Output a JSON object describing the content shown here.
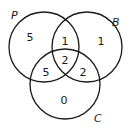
{
  "diagram": {
    "type": "venn",
    "sets": [
      {
        "name": "P",
        "label": "P"
      },
      {
        "name": "B",
        "label": "B"
      },
      {
        "name": "C",
        "label": "C"
      }
    ],
    "regions": {
      "P_only": "5",
      "B_only": "1",
      "C_only": "0",
      "P_and_B_only": "1",
      "P_and_C_only": "5",
      "B_and_C_only": "2",
      "P_and_B_and_C": "2"
    },
    "colors": {
      "stroke": "#1a1a1a",
      "background": "#ffffff"
    }
  }
}
